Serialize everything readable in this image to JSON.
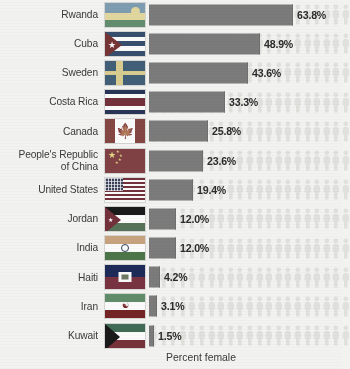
{
  "caption": "Percent female",
  "colors": {
    "bar": "#7b7b7b",
    "picto": "#e0e0dd",
    "background": "#f2f2f0",
    "text": "#3a3a3a"
  },
  "chart_data": {
    "type": "bar",
    "title": "",
    "subtitle": "",
    "xlabel": "Percent female",
    "ylabel": "",
    "xlim": [
      0,
      100
    ],
    "grid": false,
    "legend": "none",
    "units": "percent",
    "note": "Horizontal bar chart with national flag icons; faint repeating human pictograms fill the plot background as a unit chart motif.",
    "categories": [
      "Rwanda",
      "Cuba",
      "Sweden",
      "Costa Rica",
      "Canada",
      "People's Republic of China",
      "United States",
      "Jordan",
      "India",
      "Haiti",
      "Iran",
      "Kuwait"
    ],
    "values": [
      63.8,
      48.9,
      43.6,
      33.3,
      25.8,
      23.6,
      19.4,
      12.0,
      12.0,
      4.2,
      3.1,
      1.5
    ],
    "value_labels": [
      "63.8%",
      "48.9%",
      "43.6%",
      "33.3%",
      "25.8%",
      "23.6%",
      "19.4%",
      "12.0%",
      "12.0%",
      "4.2%",
      "3.1%",
      "1.5%"
    ]
  },
  "rows": [
    {
      "label": "Rwanda",
      "label_lines": "Rwanda",
      "value_label": "63.8%",
      "value": 63.8,
      "flag": "rwanda-flag",
      "bar_px": 144
    },
    {
      "label": "Cuba",
      "label_lines": "Cuba",
      "value_label": "48.9%",
      "value": 48.9,
      "flag": "cuba-flag",
      "bar_px": 111
    },
    {
      "label": "Sweden",
      "label_lines": "Sweden",
      "value_label": "43.6%",
      "value": 43.6,
      "flag": "sweden-flag",
      "bar_px": 99
    },
    {
      "label": "Costa Rica",
      "label_lines": "Costa Rica",
      "value_label": "33.3%",
      "value": 33.3,
      "flag": "costa-rica-flag",
      "bar_px": 76
    },
    {
      "label": "Canada",
      "label_lines": "Canada",
      "value_label": "25.8%",
      "value": 25.8,
      "flag": "canada-flag",
      "bar_px": 59
    },
    {
      "label": "People's Republic of China",
      "label_lines": "People's Republic\nof China",
      "value_label": "23.6%",
      "value": 23.6,
      "flag": "china-flag",
      "bar_px": 54
    },
    {
      "label": "United States",
      "label_lines": "United States",
      "value_label": "19.4%",
      "value": 19.4,
      "flag": "united-states-flag",
      "bar_px": 44
    },
    {
      "label": "Jordan",
      "label_lines": "Jordan",
      "value_label": "12.0%",
      "value": 12.0,
      "flag": "jordan-flag",
      "bar_px": 27
    },
    {
      "label": "India",
      "label_lines": "India",
      "value_label": "12.0%",
      "value": 12.0,
      "flag": "india-flag",
      "bar_px": 27
    },
    {
      "label": "Haiti",
      "label_lines": "Haiti",
      "value_label": "4.2%",
      "value": 4.2,
      "flag": "haiti-flag",
      "bar_px": 11
    },
    {
      "label": "Iran",
      "label_lines": "Iran",
      "value_label": "3.1%",
      "value": 3.1,
      "flag": "iran-flag",
      "bar_px": 8
    },
    {
      "label": "Kuwait",
      "label_lines": "Kuwait",
      "value_label": "1.5%",
      "value": 1.5,
      "flag": "kuwait-flag",
      "bar_px": 5
    }
  ]
}
